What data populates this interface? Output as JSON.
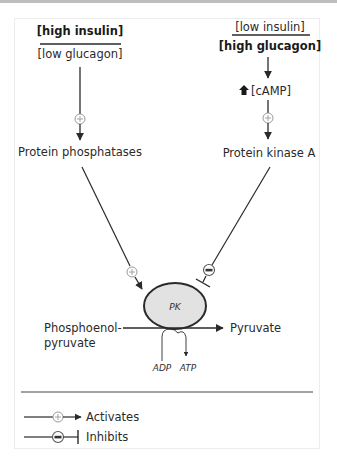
{
  "left_pathway": {
    "condition_top": "[high insulin]",
    "condition_bottom": "[low glucagon]",
    "enzyme": "Protein phosphatases",
    "effect_on_pk": "activates"
  },
  "right_pathway": {
    "condition_top": "[low insulin]",
    "condition_bottom": "[high glucagon]",
    "messenger": "[cAMP]",
    "messenger_change": "increase",
    "enzyme": "Protein kinase A",
    "effect_on_pk": "inhibits"
  },
  "reaction": {
    "enzyme_label": "PK",
    "substrate_line1": "Phosphoenol-",
    "substrate_line2": "pyruvate",
    "product": "Pyruvate",
    "cofactor_in": "ADP",
    "cofactor_out": "ATP"
  },
  "legend": {
    "activates_label": "Activates",
    "inhibits_label": "Inhibits"
  },
  "colors": {
    "line": "#2a2a2a",
    "enzyme_fill": "#e2e2e2",
    "symbol_stroke": "#9a9a9a",
    "frame": "#ececec",
    "topbar": "#bdbdbd"
  }
}
